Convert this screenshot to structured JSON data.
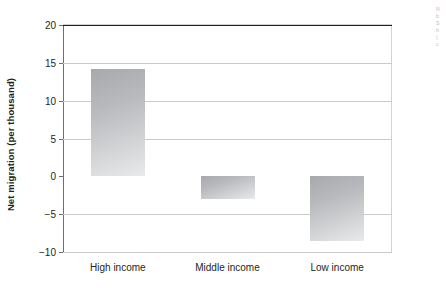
{
  "chart_data": {
    "type": "bar",
    "title": "",
    "subtitle": "",
    "xlabel": "",
    "ylabel": "Net migration (per thousand)",
    "categories": [
      "High income",
      "Middle income",
      "Low income"
    ],
    "values": [
      14.2,
      -3.0,
      -8.6
    ],
    "ylim": [
      -10,
      20
    ],
    "yticks": [
      20,
      15,
      10,
      5,
      0,
      -5,
      -10
    ],
    "ytick_labels": [
      "20",
      "15",
      "10",
      "5",
      "0",
      "−5",
      "−10"
    ],
    "grid": true,
    "gridlines_at": [
      20,
      15,
      10,
      5,
      -5,
      -10
    ],
    "zero_line": 0,
    "legend": "none",
    "orientation": "vertical",
    "bar_color": "#b8babd",
    "bar_style": "vertical gray gradient, light at bottom",
    "axis_color": "#6e6f71",
    "grid_color": "#c9cacc",
    "zero_line_color": "#231f20",
    "background": "#ffffff"
  },
  "side_caption": {
    "lines": [
      "N",
      "b",
      "S",
      "h",
      "(",
      "c"
    ]
  }
}
